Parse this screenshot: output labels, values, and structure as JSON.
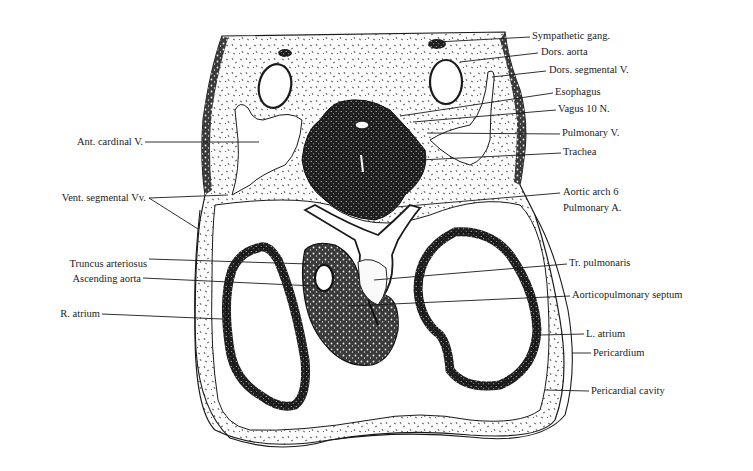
{
  "figure": {
    "colors": {
      "ink": "#1a1a1a",
      "mesenchyme_fill": "#fbfbfb",
      "dense_tissue": "#2a2a2a",
      "background": "#ffffff"
    }
  },
  "labels_right": [
    {
      "id": "sympathetic-gang",
      "text": "Sympathetic gang.",
      "x": 532,
      "y": 30
    },
    {
      "id": "dors-aorta",
      "text": "Dors. aorta",
      "x": 541,
      "y": 46
    },
    {
      "id": "dors-segmental-v",
      "text": "Dors. segmental V.",
      "x": 549,
      "y": 64
    },
    {
      "id": "esophagus",
      "text": "Esophagus",
      "x": 555,
      "y": 86
    },
    {
      "id": "vagus-10-n",
      "text": "Vagus 10 N.",
      "x": 558,
      "y": 103
    },
    {
      "id": "pulmonary-v",
      "text": "Pulmonary V.",
      "x": 562,
      "y": 127
    },
    {
      "id": "trachea",
      "text": "Trachea",
      "x": 563,
      "y": 146
    },
    {
      "id": "aortic-arch-6",
      "text": "Aortic arch 6",
      "x": 563,
      "y": 183
    },
    {
      "id": "pulmonary-a",
      "text": "Pulmonary A.",
      "x": 563,
      "y": 201
    },
    {
      "id": "tr-pulmonaris",
      "text": "Tr. pulmonaris",
      "x": 569,
      "y": 257
    },
    {
      "id": "aorticopulmonary-septum",
      "text": "Aorticopulmonary septum",
      "x": 572,
      "y": 289
    },
    {
      "id": "l-atrium",
      "text": "L. atrium",
      "x": 586,
      "y": 327
    },
    {
      "id": "pericardium",
      "text": "Pericardium",
      "x": 593,
      "y": 346
    },
    {
      "id": "pericardial-cavity",
      "text": "Pericardial cavity",
      "x": 591,
      "y": 384
    }
  ],
  "labels_left": [
    {
      "id": "ant-cardinal-v",
      "text": "Ant. cardinal V.",
      "right": 143,
      "y": 135
    },
    {
      "id": "vent-segmental-vv",
      "text": "Vent. segmental Vv.",
      "right": 146,
      "y": 191
    },
    {
      "id": "truncus-arteriosus",
      "text": "Truncus arteriosus",
      "right": 147,
      "y": 258
    },
    {
      "id": "ascending-aorta",
      "text": "Ascending aorta",
      "right": 141,
      "y": 277
    },
    {
      "id": "r-atrium",
      "text": "R. atrium",
      "right": 100,
      "y": 308
    }
  ]
}
